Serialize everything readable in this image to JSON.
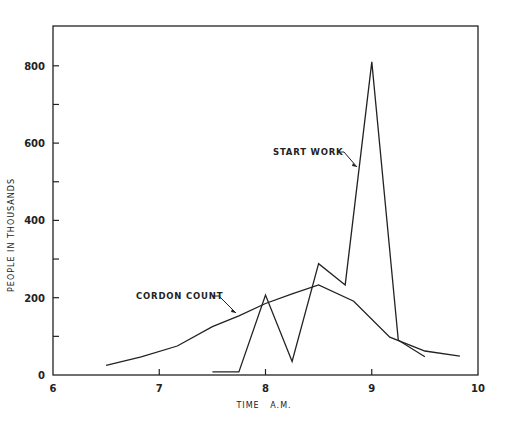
{
  "chart_data": {
    "type": "line",
    "title": "",
    "xlabel": "TIME   A.M.",
    "ylabel": "PEOPLE IN THOUSANDS",
    "xlim": [
      6,
      10
    ],
    "ylim": [
      0,
      900
    ],
    "x_ticks": [
      6,
      7,
      8,
      9,
      10
    ],
    "x_tick_labels": [
      "6",
      "7",
      "8",
      "9",
      "10"
    ],
    "y_ticks": [
      0,
      200,
      400,
      600,
      800
    ],
    "y_tick_labels": [
      "0",
      "200",
      "400",
      "600",
      "800"
    ],
    "y_minor_ticks": [
      100,
      300,
      500,
      700
    ],
    "grid": false,
    "legend": "none (inline annotations)",
    "series": [
      {
        "name": "CORDON COUNT",
        "x": [
          6.5,
          6.83,
          7.17,
          7.5,
          7.75,
          8.0,
          8.25,
          8.5,
          8.83,
          9.17,
          9.5,
          9.83
        ],
        "values": [
          25,
          47,
          75,
          125,
          153,
          185,
          210,
          233,
          191,
          98,
          62,
          49
        ]
      },
      {
        "name": "START WORK",
        "x": [
          7.5,
          7.75,
          8.0,
          8.25,
          8.5,
          8.75,
          9.0,
          9.25,
          9.5
        ],
        "values": [
          8,
          8,
          207,
          35,
          288,
          233,
          810,
          90,
          47
        ]
      }
    ],
    "annotations": [
      {
        "text": "START WORK",
        "points_to": "START WORK series near 8.9, 540"
      },
      {
        "text": "CORDON COUNT",
        "points_to": "CORDON COUNT series near 7.75, 160"
      }
    ]
  }
}
